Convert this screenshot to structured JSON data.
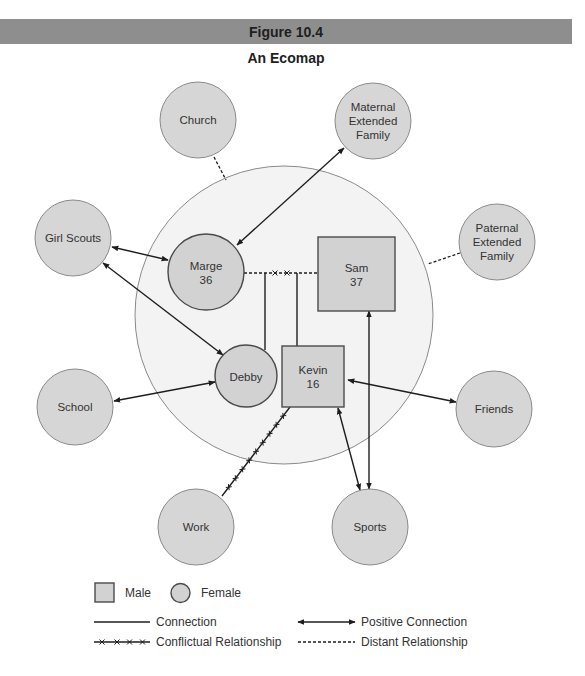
{
  "figure": {
    "number_label": "Figure 10.4",
    "title": "An Ecomap"
  },
  "nodes": {
    "church": {
      "label_lines": [
        "Church"
      ],
      "kind": "external"
    },
    "maternal_extended_family": {
      "label_lines": [
        "Maternal",
        "Extended",
        "Family"
      ],
      "kind": "external"
    },
    "girl_scouts": {
      "label_lines": [
        "Girl Scouts"
      ],
      "kind": "external"
    },
    "paternal_extended_family": {
      "label_lines": [
        "Paternal",
        "Extended",
        "Family"
      ],
      "kind": "external"
    },
    "school": {
      "label_lines": [
        "School"
      ],
      "kind": "external"
    },
    "friends": {
      "label_lines": [
        "Friends"
      ],
      "kind": "external"
    },
    "work": {
      "label_lines": [
        "Work"
      ],
      "kind": "external"
    },
    "sports": {
      "label_lines": [
        "Sports"
      ],
      "kind": "external"
    },
    "marge": {
      "label_lines": [
        "Marge",
        "36"
      ],
      "kind": "family",
      "gender": "female"
    },
    "sam": {
      "label_lines": [
        "Sam",
        "37"
      ],
      "kind": "family",
      "gender": "male"
    },
    "debby": {
      "label_lines": [
        "Debby"
      ],
      "kind": "family",
      "gender": "female"
    },
    "kevin": {
      "label_lines": [
        "Kevin",
        "16"
      ],
      "kind": "family",
      "gender": "male"
    }
  },
  "relationships": [
    {
      "from": "Church",
      "to": "Household",
      "type": "distant"
    },
    {
      "from": "Paternal Extended Family",
      "to": "Household",
      "type": "distant"
    },
    {
      "from": "Maternal Extended Family",
      "to": "Marge",
      "type": "positive"
    },
    {
      "from": "Girl Scouts",
      "to": "Marge",
      "type": "positive"
    },
    {
      "from": "Girl Scouts",
      "to": "Debby",
      "type": "positive"
    },
    {
      "from": "School",
      "to": "Debby",
      "type": "positive"
    },
    {
      "from": "Friends",
      "to": "Kevin",
      "type": "positive"
    },
    {
      "from": "Sports",
      "to": "Kevin",
      "type": "positive"
    },
    {
      "from": "Sports",
      "to": "Sam",
      "type": "positive"
    },
    {
      "from": "Work",
      "to": "Kevin",
      "type": "conflictual"
    },
    {
      "from": "Marge",
      "to": "Sam",
      "type": "distant (marked x-x)"
    },
    {
      "from": "Marge/Sam",
      "to": "Debby",
      "type": "connection"
    },
    {
      "from": "Marge/Sam",
      "to": "Kevin",
      "type": "connection"
    }
  ],
  "legend": {
    "male": "Male",
    "female": "Female",
    "connection": "Connection",
    "conflictual": "Conflictual Relationship",
    "positive": "Positive Connection",
    "distant": "Distant Relationship"
  },
  "colors": {
    "header_bar": "#8e8e8e",
    "node_fill": "#d6d6d6",
    "household_fill": "#f3f3f3",
    "line": "#1e1e1e"
  }
}
